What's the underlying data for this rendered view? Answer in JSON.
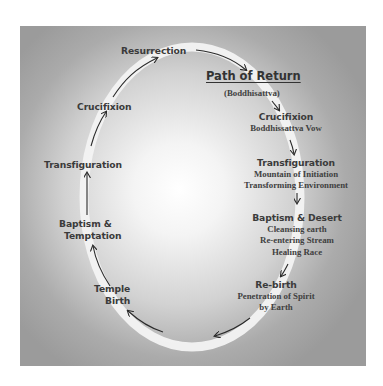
{
  "header_cutoff_text": "…",
  "diagram": {
    "title": "Path of Return",
    "subtitle": "(Boddhisattva)",
    "left_path": [
      {
        "label": "Resurrection"
      },
      {
        "label": "Crucifixion"
      },
      {
        "label": "Transfiguration"
      },
      {
        "label_lines": [
          "Baptism &",
          "Temptation"
        ]
      },
      {
        "label_lines": [
          "Temple",
          "Birth"
        ]
      }
    ],
    "right_path": [
      {
        "heading": "Crucifixion",
        "details": [
          "Boddhissattva Vow"
        ]
      },
      {
        "heading": "Transfiguration",
        "details": [
          "Mountain of Initiation",
          "Transforming Environment"
        ]
      },
      {
        "heading": "Baptism & Desert",
        "details": [
          "Cleansing earth",
          "Re-entering Stream",
          "Healing Race"
        ]
      },
      {
        "heading": "Re-birth",
        "details": [
          "Penetration of Spirit",
          "by Earth"
        ]
      }
    ],
    "colors": {
      "background_center": "#ffffff",
      "background_edge": "#9b9b9b",
      "ring": "#f2f2f2",
      "text": "#3b3b3b",
      "arrow": "#2a2a2a"
    }
  }
}
